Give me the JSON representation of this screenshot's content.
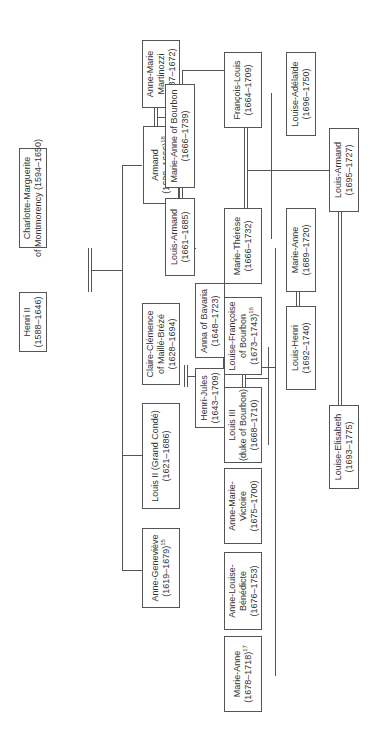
{
  "diagram": {
    "type": "family-tree",
    "orientation": "rotated-90",
    "nodes": [
      {
        "id": "henri2",
        "lines": [
          "Henri II",
          "(1588–1646)"
        ],
        "note": ""
      },
      {
        "id": "charlotte",
        "lines": [
          "Charlotte-Marguerite",
          "of Montmorency (1594–1650)"
        ],
        "note": ""
      },
      {
        "id": "armand",
        "lines": [
          "Armand",
          "(1629–1666)"
        ],
        "note": "18"
      },
      {
        "id": "annemarie_martinozzi",
        "lines": [
          "Anne-Marie",
          "Martinozzi",
          "(1637–1672)"
        ],
        "note": ""
      },
      {
        "id": "louis2",
        "lines": [
          "Louis II (Grand Condé)",
          "(1621–1686)"
        ],
        "note": ""
      },
      {
        "id": "claire",
        "lines": [
          "Claire-Clémence",
          "of Maillé-Brézé",
          "(1628–1694)"
        ],
        "note": ""
      },
      {
        "id": "annegenevieve",
        "lines": [
          "Anne-Geneviève",
          "(1619–1679)"
        ],
        "note": "15"
      },
      {
        "id": "louisarmand1",
        "lines": [
          "Louis-Armand",
          "(1661–1685)"
        ],
        "note": ""
      },
      {
        "id": "marieanne_bourbon",
        "lines": [
          "Marie-Anne of Bourbon",
          "(1666–1739)"
        ],
        "note": ""
      },
      {
        "id": "francoislouis",
        "lines": [
          "François-Louis",
          "(1664–1709)"
        ],
        "note": ""
      },
      {
        "id": "mariethérèse",
        "lines": [
          "Marie-Thérèse",
          "(1666–1732)"
        ],
        "note": ""
      },
      {
        "id": "henrijules",
        "lines": [
          "Henri-Jules",
          "(1643–1709)"
        ],
        "note": ""
      },
      {
        "id": "anna_bavaria",
        "lines": [
          "Anna of Bavaria",
          "(1648–1723)"
        ],
        "note": ""
      },
      {
        "id": "louis3",
        "lines": [
          "Louis III",
          "(duke of Bourbon)",
          "(1668–1710)"
        ],
        "note": ""
      },
      {
        "id": "louisefrancoise",
        "lines": [
          "Louise-Françoise",
          "of Bourbon",
          "(1673–1743)"
        ],
        "note": "16"
      },
      {
        "id": "annemarievictoire",
        "lines": [
          "Anne-Marie-",
          "Victoire",
          "(1675–1700)"
        ],
        "note": ""
      },
      {
        "id": "annelouise",
        "lines": [
          "Anne-Louise-",
          "Bénédicte",
          "(1676–1753)"
        ],
        "note": ""
      },
      {
        "id": "marieanne1678",
        "lines": [
          "Marie-Anne",
          "(1678–1718)"
        ],
        "note": "17"
      },
      {
        "id": "louiseadelaide",
        "lines": [
          "Louise-Adélaïde",
          "(1696–1750)"
        ],
        "note": ""
      },
      {
        "id": "marieanne1689",
        "lines": [
          "Marie-Anne",
          "(1689–1720)"
        ],
        "note": ""
      },
      {
        "id": "louisarmand2",
        "lines": [
          "Louis-Armand",
          "(1695–1727)"
        ],
        "note": ""
      },
      {
        "id": "louishenri",
        "lines": [
          "Louis-Henri",
          "(1692–1740)"
        ],
        "note": ""
      },
      {
        "id": "louiseelisabeth",
        "lines": [
          "Louise-Elisabeth",
          "(1693–1775)"
        ],
        "note": ""
      }
    ],
    "marriages": [
      [
        "henri2",
        "charlotte"
      ],
      [
        "armand",
        "annemarie_martinozzi"
      ],
      [
        "louis2",
        "claire"
      ],
      [
        "louisarmand1",
        "marieanne_bourbon"
      ],
      [
        "francoislouis",
        "mariethérèse"
      ],
      [
        "henrijules",
        "anna_bavaria"
      ],
      [
        "louis3",
        "louisefrancoise"
      ],
      [
        "louishenri",
        "marieanne1689"
      ],
      [
        "louisarmand2",
        "louiseelisabeth"
      ]
    ],
    "children": {
      "henri2+charlotte": [
        "armand",
        "louis2",
        "annegenevieve"
      ],
      "armand+annemarie_martinozzi": [
        "louisarmand1",
        "francoislouis"
      ],
      "louis2+claire": [
        "henrijules"
      ],
      "henrijules+anna_bavaria": [
        "mariethérèse",
        "louis3",
        "annemarievictoire",
        "annelouise",
        "marieanne1678"
      ],
      "francoislouis+mariethérèse": [
        "louiseadelaide",
        "marieanne1689",
        "louisarmand2"
      ],
      "louis3+louisefrancoise": [
        "louishenri",
        "louiseelisabeth"
      ]
    }
  }
}
